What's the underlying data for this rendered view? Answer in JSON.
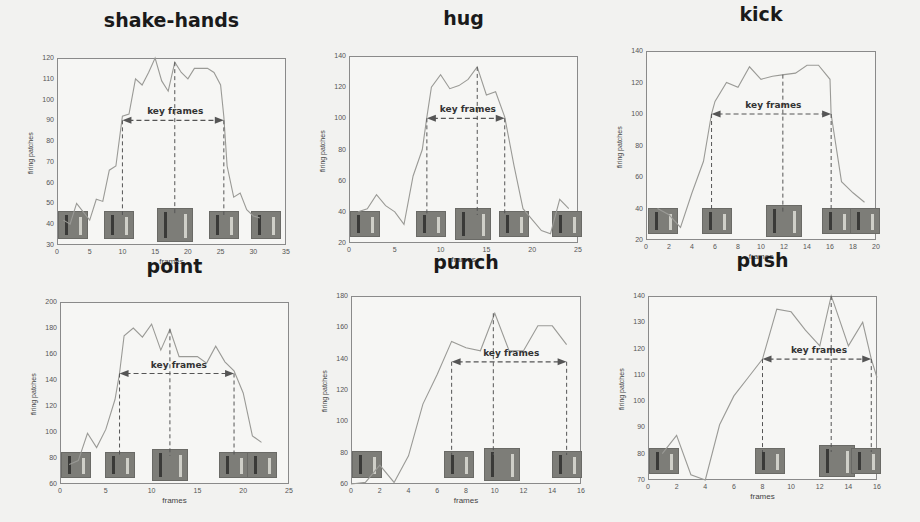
{
  "chart_data": [
    {
      "type": "line",
      "title": "shake-hands",
      "xlabel": "frames",
      "ylabel": "firing patches",
      "xlim": [
        0,
        35
      ],
      "ylim": [
        30,
        120
      ],
      "xticks": [
        0,
        5,
        10,
        15,
        20,
        25,
        30,
        35
      ],
      "yticks": [
        30,
        40,
        50,
        60,
        70,
        80,
        90,
        100,
        110,
        120
      ],
      "annotation": "key frames",
      "key_frame_range": [
        10,
        25.5
      ],
      "key_frame_arrow_y": 90,
      "key_frame_markers": [
        10,
        18,
        25.5
      ],
      "series": [
        {
          "name": "firing patches",
          "x": [
            1,
            2,
            3,
            4,
            5,
            6,
            7,
            8,
            9,
            10,
            11,
            12,
            13,
            14,
            15,
            16,
            17,
            18,
            19,
            20,
            21,
            22,
            23,
            24,
            25,
            25.5,
            26,
            27,
            28,
            29,
            30,
            31
          ],
          "values": [
            42,
            40,
            50,
            46,
            42,
            52,
            51,
            66,
            68,
            92,
            93,
            110,
            107,
            113,
            120,
            109,
            104,
            118,
            113,
            110,
            115,
            115,
            115,
            113,
            107,
            92,
            68,
            53,
            55,
            47,
            44,
            43
          ]
        }
      ],
      "thumbnails_at_x": [
        2.5,
        9.5,
        18,
        25.5,
        32
      ]
    },
    {
      "type": "line",
      "title": "hug",
      "xlabel": "frames",
      "ylabel": "firing patches",
      "xlim": [
        0,
        25
      ],
      "ylim": [
        20,
        140
      ],
      "xticks": [
        0,
        5,
        10,
        15,
        20,
        25
      ],
      "yticks": [
        20,
        40,
        60,
        80,
        100,
        120,
        140
      ],
      "annotation": "key frames",
      "key_frame_range": [
        8.5,
        17
      ],
      "key_frame_arrow_y": 100,
      "key_frame_markers": [
        8.5,
        14,
        17
      ],
      "series": [
        {
          "name": "firing patches",
          "x": [
            1,
            2,
            3,
            4,
            5,
            6,
            7,
            8,
            8.5,
            9,
            10,
            11,
            12,
            13,
            14,
            15,
            16,
            17,
            18,
            19,
            20,
            21,
            22,
            23,
            24
          ],
          "values": [
            40,
            42,
            51,
            44,
            40,
            32,
            63,
            80,
            101,
            120,
            128,
            119,
            121,
            125,
            133,
            115,
            117,
            101,
            70,
            42,
            35,
            28,
            26,
            48,
            42
          ]
        }
      ],
      "thumbnails_at_x": [
        1.5,
        9,
        13.5,
        18,
        24
      ]
    },
    {
      "type": "line",
      "title": "kick",
      "xlabel": "frames",
      "ylabel": "firing patches",
      "xlim": [
        0,
        20
      ],
      "ylim": [
        20,
        140
      ],
      "xticks": [
        0,
        2,
        4,
        6,
        8,
        10,
        12,
        14,
        16,
        18,
        20
      ],
      "yticks": [
        20,
        40,
        60,
        80,
        100,
        120,
        140
      ],
      "annotation": "key frames",
      "key_frame_range": [
        5.7,
        16.1
      ],
      "key_frame_arrow_y": 100,
      "key_frame_markers": [
        5.7,
        11.9,
        16.1
      ],
      "series": [
        {
          "name": "firing patches",
          "x": [
            1,
            2,
            3,
            4,
            5,
            5.7,
            6,
            7,
            8,
            9,
            10,
            11,
            12,
            13,
            14,
            15,
            16,
            16.1,
            17,
            18,
            19
          ],
          "values": [
            40,
            36,
            28,
            50,
            70,
            100,
            108,
            120,
            117,
            130,
            122,
            124,
            125,
            126,
            131,
            131,
            122,
            100,
            57,
            50,
            44
          ]
        }
      ],
      "thumbnails_at_x": [
        1.5,
        6.2,
        12,
        16.6,
        19.2
      ]
    },
    {
      "type": "line",
      "title": "point",
      "xlabel": "frames",
      "ylabel": "firing patches",
      "xlim": [
        0,
        25
      ],
      "ylim": [
        60,
        200
      ],
      "xticks": [
        0,
        5,
        10,
        15,
        20,
        25
      ],
      "yticks": [
        60,
        80,
        100,
        120,
        140,
        160,
        180,
        200
      ],
      "annotation": "key frames",
      "key_frame_range": [
        6.5,
        19
      ],
      "key_frame_arrow_y": 145,
      "key_frame_markers": [
        6.5,
        12,
        19
      ],
      "series": [
        {
          "name": "firing patches",
          "x": [
            1,
            2,
            3,
            4,
            5,
            6,
            6.5,
            7,
            8,
            9,
            10,
            11,
            12,
            13,
            14,
            15,
            16,
            17,
            18,
            19,
            20,
            21,
            22
          ],
          "values": [
            75,
            78,
            99,
            88,
            102,
            125,
            145,
            174,
            180,
            173,
            183,
            163,
            179,
            158,
            158,
            158,
            153,
            166,
            154,
            147,
            130,
            97,
            92
          ]
        }
      ],
      "thumbnails_at_x": [
        1,
        6.5,
        12,
        19,
        22
      ]
    },
    {
      "type": "line",
      "title": "punch",
      "xlabel": "frames",
      "ylabel": "firing patches",
      "xlim": [
        0,
        16
      ],
      "ylim": [
        60,
        180
      ],
      "xticks": [
        0,
        2,
        4,
        6,
        8,
        10,
        12,
        14,
        16
      ],
      "yticks": [
        60,
        80,
        100,
        120,
        140,
        160,
        180
      ],
      "annotation": "key frames",
      "key_frame_range": [
        7,
        15
      ],
      "key_frame_arrow_y": 138,
      "key_frame_markers": [
        7,
        9.9,
        15
      ],
      "series": [
        {
          "name": "firing patches",
          "x": [
            0,
            1,
            2,
            3,
            4,
            5,
            6,
            7,
            8,
            9,
            10,
            11,
            12,
            13,
            14,
            15
          ],
          "values": [
            60,
            61,
            72,
            61,
            78,
            111,
            130,
            151,
            147,
            145,
            169,
            145,
            145,
            161,
            161,
            149
          ]
        }
      ],
      "thumbnails_at_x": [
        1,
        7.5,
        10.5,
        15
      ]
    },
    {
      "type": "line",
      "title": "push",
      "xlabel": "frames",
      "ylabel": "firing patches",
      "xlim": [
        0,
        16
      ],
      "ylim": [
        70,
        140
      ],
      "xticks": [
        0,
        2,
        4,
        6,
        8,
        10,
        12,
        14,
        16
      ],
      "yticks": [
        70,
        80,
        90,
        100,
        110,
        120,
        130,
        140
      ],
      "annotation": "key frames",
      "key_frame_range": [
        8,
        15.6
      ],
      "key_frame_arrow_y": 116,
      "key_frame_markers": [
        8,
        12.8,
        15.6
      ],
      "series": [
        {
          "name": "firing patches",
          "x": [
            1,
            2,
            3,
            4,
            5,
            6,
            7,
            8,
            9,
            10,
            11,
            12,
            12.8,
            13,
            14,
            15,
            15.6,
            16
          ],
          "values": [
            80,
            87,
            72,
            70,
            91,
            102,
            109,
            116,
            135,
            134,
            127,
            121,
            140,
            137,
            121,
            130,
            116,
            109
          ]
        }
      ],
      "thumbnails_at_x": [
        1,
        8.5,
        13.2,
        15.6
      ]
    }
  ]
}
